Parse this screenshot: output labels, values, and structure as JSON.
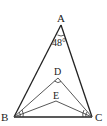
{
  "diagram": {
    "type": "geometry-triangle",
    "points": {
      "A": {
        "label": "A",
        "x": 61,
        "y": 25
      },
      "B": {
        "label": "B",
        "x": 14,
        "y": 117
      },
      "C": {
        "label": "C",
        "x": 92,
        "y": 117
      },
      "D": {
        "label": "D",
        "x": 58,
        "y": 78
      },
      "E": {
        "label": "E",
        "x": 56,
        "y": 101
      }
    },
    "angle_label": "48°",
    "segments": [
      "AB",
      "AC",
      "BC",
      "BD",
      "CD",
      "BE",
      "CE"
    ],
    "colors": {
      "stroke": "#222222",
      "thin_stroke": "#444444"
    }
  }
}
